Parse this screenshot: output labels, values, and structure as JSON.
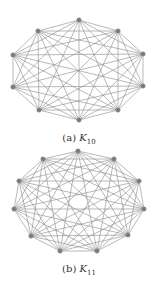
{
  "figures": [
    {
      "id": "a",
      "label": "(a)",
      "graph_symbol": "K",
      "graph_subscript": "10",
      "nodes": [
        [
          79,
          20
        ],
        [
          118,
          31
        ],
        [
          143,
          54
        ],
        [
          143,
          86
        ],
        [
          118,
          110
        ],
        [
          79,
          120
        ],
        [
          39,
          110
        ],
        [
          13,
          87
        ],
        [
          13,
          55
        ],
        [
          38,
          31
        ]
      ]
    },
    {
      "id": "b",
      "label": "(b)",
      "graph_symbol": "K",
      "graph_subscript": "11",
      "nodes": [
        [
          78,
          151
        ],
        [
          114,
          159
        ],
        [
          139,
          181
        ],
        [
          144,
          209
        ],
        [
          128,
          235
        ],
        [
          97,
          251
        ],
        [
          60,
          251
        ],
        [
          31,
          236
        ],
        [
          14,
          209
        ],
        [
          19,
          181
        ],
        [
          43,
          159
        ]
      ]
    }
  ],
  "colors": {
    "edge": "#8a8a8a",
    "node": "#7a7a7a",
    "background": "#ffffff"
  }
}
